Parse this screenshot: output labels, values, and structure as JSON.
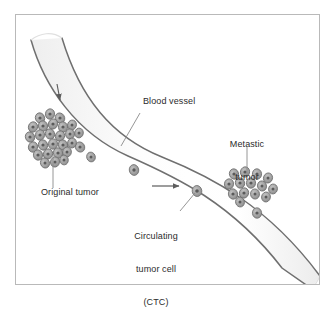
{
  "figure": {
    "frame": {
      "x": 15,
      "y": 14,
      "width": 305,
      "height": 271,
      "border_color": "#b9b9b9",
      "background_color": "#ffffff"
    },
    "colors": {
      "page_background": "#ffffff",
      "vessel_wall": "#6f6f6f",
      "vessel_lumen_light": "#ffffff",
      "vessel_lumen_shade": "#f0f0f0",
      "cell_fill": "#9a9a9a",
      "cell_outline": "#6e6e6e",
      "cell_nucleus": "#5a5a5a",
      "leader_line": "#8a8a8a",
      "arrow": "#5d5d5d",
      "label_text": "#2b2b2b"
    },
    "labels": [
      {
        "id": "blood-vessel",
        "text": "Blood vessel",
        "x": 143,
        "y": 101,
        "align": "left",
        "leader": {
          "x1": 140,
          "y1": 113,
          "x2": 121,
          "y2": 146
        }
      },
      {
        "id": "original-tumor",
        "text": "Original tumor",
        "x": 41,
        "y": 192,
        "align": "left",
        "leader": {
          "x1": 53,
          "y1": 188,
          "x2": 53,
          "y2": 155
        }
      },
      {
        "id": "metastic-tumor",
        "text": "Metastic\ntumor",
        "line1": "Metastic",
        "line2": "tumor",
        "x": 222,
        "y": 122,
        "align": "center",
        "leader": {
          "x1": 247,
          "y1": 147,
          "x2": 247,
          "y2": 174
        }
      },
      {
        "id": "circulating-tumor-cell",
        "text": "Circulating\ntumor cell\n(CTC)",
        "line1": "Circulating",
        "line2": "tumor cell",
        "line3": "(CTC)",
        "x": 126,
        "y": 214,
        "align": "center",
        "leader": {
          "x1": 180,
          "y1": 211,
          "x2": 196,
          "y2": 192
        }
      }
    ],
    "flow_arrows": [
      {
        "id": "flow-arrow-upper",
        "direction": "down",
        "x1": 57,
        "y1": 85,
        "x2": 60,
        "y2": 101
      },
      {
        "id": "flow-arrow-lower",
        "direction": "right",
        "x1": 152,
        "y1": 186,
        "x2": 180,
        "y2": 186
      }
    ],
    "tumor_clusters": [
      {
        "id": "original-tumor-cluster",
        "label": "Original tumor",
        "cell_count": 26,
        "center_x": 55,
        "center_y": 133
      },
      {
        "id": "metastic-tumor-cluster",
        "label": "Metastic tumor",
        "cell_count": 14,
        "center_x": 248,
        "center_y": 186
      }
    ],
    "circulating_cells": {
      "id": "circulating-tumor-cells",
      "label": "Circulating tumor cell (CTC)",
      "count": 5
    }
  }
}
